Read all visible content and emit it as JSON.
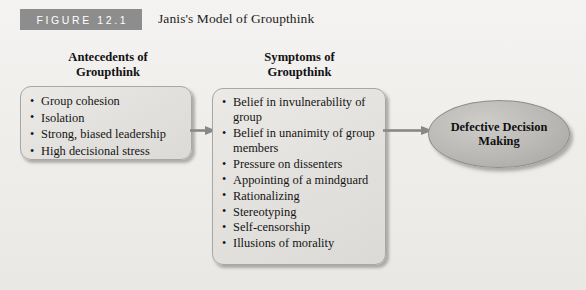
{
  "figure": {
    "banner_label": "FIGURE 12.1",
    "title": "Janis's Model of Groupthink",
    "banner_color": "#8d8d8d",
    "background_color": "#f2f1ef"
  },
  "antecedents": {
    "heading": "Antecedents of\nGroupthink",
    "items": [
      "Group cohesion",
      "Isolation",
      "Strong, biased leadership",
      "High decisional stress"
    ]
  },
  "symptoms": {
    "heading": "Symptoms of\nGroupthink",
    "items": [
      "Belief in invulnerability of group",
      "Belief in unanimity of group members",
      "Pressure on dissenters",
      "Appointing of a mindguard",
      "Rationalizing",
      "Stereotyping",
      "Self-censorship",
      "Illusions of morality"
    ]
  },
  "outcome": {
    "label": "Defective Decision\nMaking",
    "fill_color": "#bab8b4"
  },
  "connectors": [
    {
      "name": "antecedents-to-symptoms",
      "color": "#8a8884"
    },
    {
      "name": "symptoms-to-outcome",
      "color": "#8a8884"
    }
  ]
}
